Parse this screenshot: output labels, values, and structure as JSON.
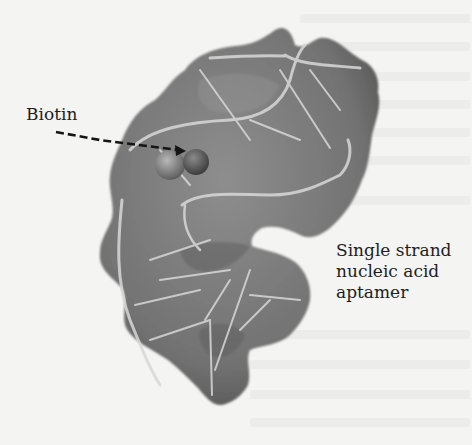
{
  "figure": {
    "type": "molecular-surface-diagram",
    "labels": {
      "biotin": "Biotin",
      "aptamer_line1": "Single strand",
      "aptamer_line2": "nucleic acid",
      "aptamer_line3": "aptamer"
    },
    "colors": {
      "surface": "#7a7a7a",
      "surface_dark": "#4e4e4e",
      "backbone": "#d6d6d6",
      "text": "#1e1e1e",
      "background": "#f4f4f2"
    }
  }
}
